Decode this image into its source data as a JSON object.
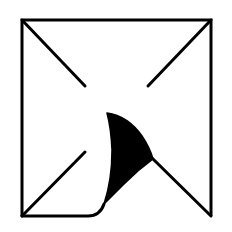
{
  "icon": {
    "name": "page-curl-envelope-icon",
    "description": "Square frame with diagonal corner lines and a curled page corner",
    "colors": {
      "background": "#ffffff",
      "stroke": "#000000",
      "fill": "#000000"
    }
  }
}
